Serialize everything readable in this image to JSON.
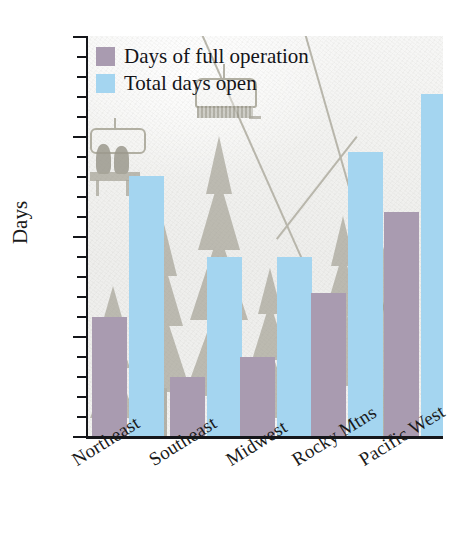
{
  "chart_data": {
    "type": "bar",
    "title": "",
    "xlabel": "",
    "ylabel": "Days",
    "categories": [
      "Northeast",
      "Southeast",
      "Midwest",
      "Rocky Mtns",
      "Pacific West"
    ],
    "series": [
      {
        "name": "Days of full operation",
        "color": "#a99bb0",
        "values": [
          60,
          30,
          40,
          72,
          112
        ]
      },
      {
        "name": "Total days open",
        "color": "#a4d5f0",
        "values": [
          130,
          90,
          90,
          142,
          171
        ]
      }
    ],
    "ylim": [
      0,
      200
    ],
    "y_ticks": [
      0,
      50,
      100,
      150,
      200
    ],
    "y_tick_labels": [
      "0",
      "50",
      "100",
      "150",
      "200"
    ],
    "y_minor_tick_step": 10,
    "grid": false,
    "legend_position": "upper-left",
    "background_image": "snowy-ski-slope-with-chairlift-and-pine-trees"
  },
  "legend": {
    "items": [
      {
        "label": "Days of full operation",
        "swatch": "purple-swatch"
      },
      {
        "label": "Total days open",
        "swatch": "blue-swatch"
      }
    ]
  },
  "axes": {
    "y_title": "Days"
  }
}
